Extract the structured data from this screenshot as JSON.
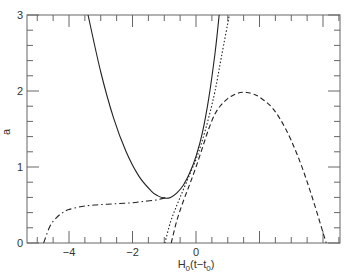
{
  "chart_data": {
    "type": "line",
    "title": "",
    "xlabel": "H0(t-t0)",
    "xlabel_parts": {
      "base": "H",
      "sub0": "0",
      "mid": "(t−t",
      "sub1": "0",
      "end": ")"
    },
    "ylabel": "a",
    "xlim": [
      -5.3,
      4.5
    ],
    "ylim": [
      0,
      3
    ],
    "grid": false,
    "legend": "none",
    "x_ticks": [
      -4,
      -2,
      0
    ],
    "x_tick_labels": [
      "−4",
      "−2",
      "0"
    ],
    "y_ticks": [
      0,
      1,
      2,
      3
    ],
    "y_tick_labels": [
      "0",
      "1",
      "2",
      "3"
    ],
    "series": [
      {
        "name": "solid",
        "style": "solid",
        "x": [
          -3.4,
          -3.0,
          -2.6,
          -2.2,
          -1.8,
          -1.4,
          -1.2,
          -1.0,
          -0.8,
          -0.6,
          -0.4,
          -0.2,
          0.0,
          0.2,
          0.4,
          0.6,
          0.73
        ],
        "y": [
          3.0,
          2.25,
          1.65,
          1.2,
          0.88,
          0.68,
          0.62,
          0.59,
          0.6,
          0.66,
          0.76,
          0.92,
          1.14,
          1.45,
          1.9,
          2.5,
          3.0
        ]
      },
      {
        "name": "dotted",
        "style": "dotted",
        "x": [
          -0.98,
          -0.8,
          -0.6,
          -0.4,
          -0.2,
          0.0,
          0.2,
          0.4,
          0.6,
          0.8,
          1.05
        ],
        "y": [
          0.0,
          0.28,
          0.5,
          0.7,
          0.9,
          1.1,
          1.35,
          1.65,
          2.0,
          2.45,
          3.0
        ]
      },
      {
        "name": "dashed",
        "style": "dashed",
        "x": [
          -0.78,
          -0.6,
          -0.4,
          -0.2,
          0.0,
          0.2,
          0.4,
          0.6,
          0.8,
          1.0,
          1.2,
          1.4,
          1.6,
          1.8,
          2.0,
          2.4,
          2.8,
          3.2,
          3.6,
          4.1
        ],
        "y": [
          0.0,
          0.3,
          0.55,
          0.77,
          1.0,
          1.25,
          1.5,
          1.7,
          1.82,
          1.9,
          1.95,
          1.98,
          1.98,
          1.96,
          1.92,
          1.78,
          1.52,
          1.15,
          0.68,
          0.0
        ]
      },
      {
        "name": "dash-dot",
        "style": "dashdot",
        "x": [
          -4.8,
          -4.6,
          -4.4,
          -4.2,
          -4.0,
          -3.6,
          -3.2,
          -2.8,
          -2.4,
          -2.0,
          -1.6,
          -1.2,
          -0.9
        ],
        "y": [
          0.0,
          0.22,
          0.33,
          0.4,
          0.44,
          0.48,
          0.5,
          0.51,
          0.52,
          0.53,
          0.55,
          0.57,
          0.61
        ]
      }
    ]
  }
}
